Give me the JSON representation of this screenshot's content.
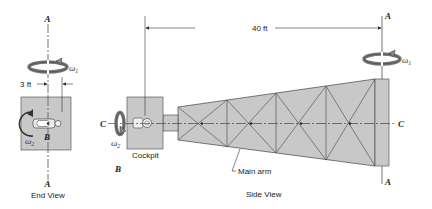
{
  "diagram": {
    "colors": {
      "fill": "#c8c8c8",
      "stroke": "#333333",
      "background": "#ffffff"
    },
    "end_view": {
      "label": "End View",
      "axis_top_label": "A",
      "axis_bottom_label": "A",
      "center_label": "B",
      "omega1_label": "ω",
      "omega1_sub": "1",
      "omega2_label": "ω",
      "omega2_sub": "2",
      "dimension_label": "3 ft"
    },
    "side_view": {
      "label": "Side View",
      "cockpit_label": "Cockpit",
      "main_arm_label": "Main arm",
      "point_b_label": "B",
      "axis_c_left_label": "C",
      "axis_c_right_label": "C",
      "axis_a_top_label": "A",
      "axis_a_bottom_label": "A",
      "omega1_label": "ω",
      "omega1_sub": "1",
      "omega2_label": "ω",
      "omega2_sub": "2",
      "dimension_label": "40 ft"
    }
  }
}
